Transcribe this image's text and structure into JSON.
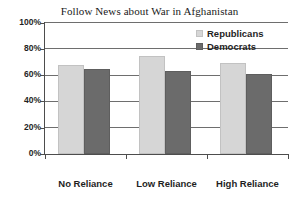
{
  "chart_data": {
    "type": "bar",
    "title": "Follow News about War in Afghanistan",
    "xlabel": "",
    "ylabel": "",
    "ylim": [
      0,
      100
    ],
    "yticks": [
      "0%",
      "20%",
      "40%",
      "60%",
      "80%",
      "100%"
    ],
    "ytick_values": [
      0,
      20,
      40,
      60,
      80,
      100
    ],
    "grid": "horizontal",
    "legend_position": "top-right inside plot",
    "categories": [
      "No Reliance",
      "Low Reliance",
      "High Reliance"
    ],
    "series": [
      {
        "name": "Republicans",
        "color": "#d6d6d6",
        "values": [
          68,
          75,
          69
        ]
      },
      {
        "name": "Democrats",
        "color": "#6b6b6b",
        "values": [
          65,
          63,
          61
        ]
      }
    ]
  },
  "legend": {
    "items": [
      {
        "label": "Republicans"
      },
      {
        "label": "Democrats"
      }
    ]
  }
}
